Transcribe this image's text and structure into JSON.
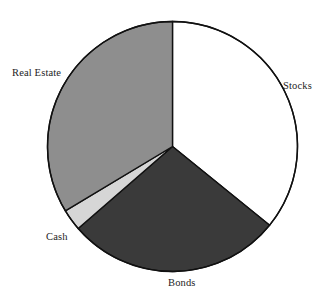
{
  "figure": {
    "name": "asset-allocation-pie-chart",
    "background_color": "#ffffff",
    "outline_color": "#000000"
  },
  "chart_data": {
    "type": "pie",
    "title": "",
    "subtitle": "",
    "xlabel": "",
    "ylabel": "",
    "legend_position": "none",
    "labels_position": "outside",
    "grid": false,
    "start_angle_deg": 0,
    "direction": "clockwise",
    "categories": [
      "Stocks",
      "Bonds",
      "Cash",
      "Real Estate"
    ],
    "values": [
      36,
      28,
      3,
      33
    ],
    "units": "percent",
    "slices": [
      {
        "label": "Stocks",
        "value": 36,
        "start_angle_deg": 0,
        "end_angle_deg": 129,
        "color": "#ffffff",
        "edge_color": "#111111"
      },
      {
        "label": "Bonds",
        "value": 28,
        "start_angle_deg": 129,
        "end_angle_deg": 229,
        "color": "#3a3a3a",
        "edge_color": "#111111"
      },
      {
        "label": "Cash",
        "value": 3,
        "start_angle_deg": 229,
        "end_angle_deg": 239,
        "color": "#d6d6d6",
        "edge_color": "#111111"
      },
      {
        "label": "Real Estate",
        "value": 33,
        "start_angle_deg": 239,
        "end_angle_deg": 360,
        "color": "#8e8e8e",
        "edge_color": "#111111"
      }
    ],
    "geometry": {
      "center_x": 172.5,
      "center_y": 146.5,
      "radius": 125
    }
  },
  "labels": {
    "real_estate": "Real Estate",
    "stocks": "Stocks",
    "cash": "Cash",
    "bonds": "Bonds"
  }
}
